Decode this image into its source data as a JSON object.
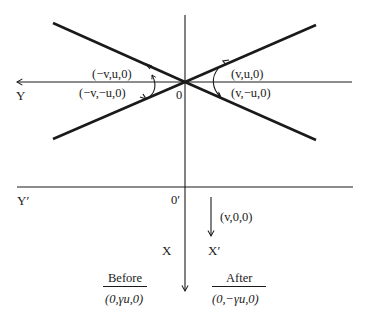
{
  "diagram": {
    "upper_frame": {
      "axis_y_label": "Y",
      "origin_label": "0",
      "velocities": {
        "upper_left": "(−v,u,0)",
        "lower_left": "(−v,−u,0)",
        "upper_right": "(v,u,0)",
        "lower_right": "(v,−u,0)"
      }
    },
    "lower_frame": {
      "axis_y_label": "Y′",
      "origin_label": "0′",
      "axis_x_label": "X",
      "axis_x_prime_label": "X′",
      "frame_velocity": "(v,0,0)"
    },
    "comparison": {
      "before_heading": "Before",
      "before_value": "(0,γu,0)",
      "after_heading": "After",
      "after_value": "(0,−γu,0)"
    }
  },
  "colors": {
    "line": "#1a1a1a",
    "background": "#ffffff"
  }
}
